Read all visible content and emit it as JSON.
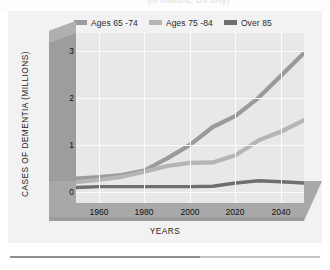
{
  "top_caption": "(in millions, US only)",
  "legend": {
    "position": "top",
    "items": [
      {
        "label": "Ages 65 -74",
        "color": "#9a9a9a"
      },
      {
        "label": "Ages 75 -84",
        "color": "#b5b5b5"
      },
      {
        "label": "Over 85",
        "color": "#6e6e6e"
      }
    ]
  },
  "axes": {
    "ylabel": "CASES OF DEMENTIA (MILLIONS)",
    "xlabel": "YEARS",
    "yticks": [
      "0",
      "1",
      "2",
      "3"
    ],
    "xticks": [
      "1960",
      "1980",
      "2000",
      "2020",
      "2040"
    ]
  },
  "colors": {
    "page_background": "#ffffff",
    "card_background": "#f2f2f2",
    "plot_background": "#e8e8e8",
    "gridline": "#fbfbfb",
    "wall_dark": "#9d9d9d",
    "wall_light": "#c9c9c9",
    "floor": "#a8a8a8",
    "rule": "#8f8f8f",
    "tick_text": "#111111",
    "axis_title": "#1d1d1d"
  },
  "chart_data": {
    "type": "line",
    "title": "",
    "subtitle": "",
    "xlabel": "YEARS",
    "ylabel": "CASES OF DEMENTIA (MILLIONS)",
    "xlim": [
      1950,
      2050
    ],
    "ylim": [
      0,
      3.3
    ],
    "yticks": [
      0,
      1,
      2,
      3
    ],
    "xticks": [
      1960,
      1980,
      2000,
      2020,
      2040
    ],
    "grid": true,
    "legend_position": "top",
    "x": [
      1950,
      1960,
      1970,
      1980,
      1990,
      2000,
      2010,
      2020,
      2030,
      2040,
      2050
    ],
    "series": [
      {
        "name": "Ages 65 -74",
        "color": "#9a9a9a",
        "values": [
          0.3,
          0.33,
          0.38,
          0.48,
          0.75,
          1.05,
          1.45,
          1.7,
          2.1,
          2.6,
          3.1
        ]
      },
      {
        "name": "Ages 75 -84",
        "color": "#b5b5b5",
        "values": [
          0.22,
          0.27,
          0.34,
          0.45,
          0.58,
          0.65,
          0.66,
          0.82,
          1.15,
          1.35,
          1.6
        ]
      },
      {
        "name": "Over 85",
        "color": "#6e6e6e",
        "values": [
          0.1,
          0.12,
          0.12,
          0.12,
          0.12,
          0.12,
          0.13,
          0.2,
          0.25,
          0.23,
          0.2
        ]
      }
    ]
  }
}
